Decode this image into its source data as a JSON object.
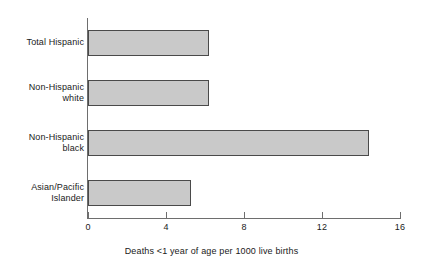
{
  "chart_data": {
    "type": "bar",
    "orientation": "horizontal",
    "title": "",
    "subtitle": "",
    "categories": [
      "Total Hispanic",
      "Non-Hispanic white",
      "Non-Hispanic black",
      "Asian/Pacific Islander"
    ],
    "category_lines": [
      [
        "Total Hispanic"
      ],
      [
        "Non-Hispanic",
        "white"
      ],
      [
        "Non-Hispanic",
        "black"
      ],
      [
        "Asian/Pacific",
        "Islander"
      ]
    ],
    "values": [
      6.2,
      6.2,
      14.4,
      5.3
    ],
    "xlabel": "Deaths <1 year of age per 1000 live births",
    "ylabel": "",
    "xlim": [
      0,
      16
    ],
    "xticks": [
      0,
      4,
      8,
      12,
      16
    ],
    "xtick_labels": [
      "0",
      "4",
      "8",
      "12",
      "16"
    ],
    "grid": false,
    "legend": false,
    "bar_fill_color": "#c9c9c9",
    "bar_edge_color": "#4a4a4a",
    "axis_color": "#6e6e6e",
    "background_color": "#ffffff"
  }
}
